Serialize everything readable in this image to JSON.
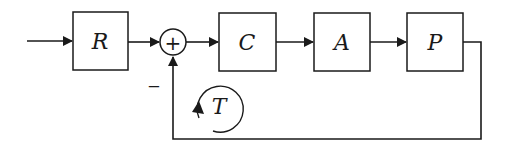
{
  "diagram": {
    "type": "feedback-control-block-diagram",
    "blocks": [
      {
        "id": "R",
        "label": "R"
      },
      {
        "id": "C",
        "label": "C"
      },
      {
        "id": "A",
        "label": "A"
      },
      {
        "id": "P",
        "label": "P"
      }
    ],
    "summing_junction": {
      "symbol": "+",
      "feedback_sign": "−"
    },
    "loop_label": "T",
    "colors": {
      "stroke": "#1a1a1a",
      "background": "#ffffff"
    }
  }
}
